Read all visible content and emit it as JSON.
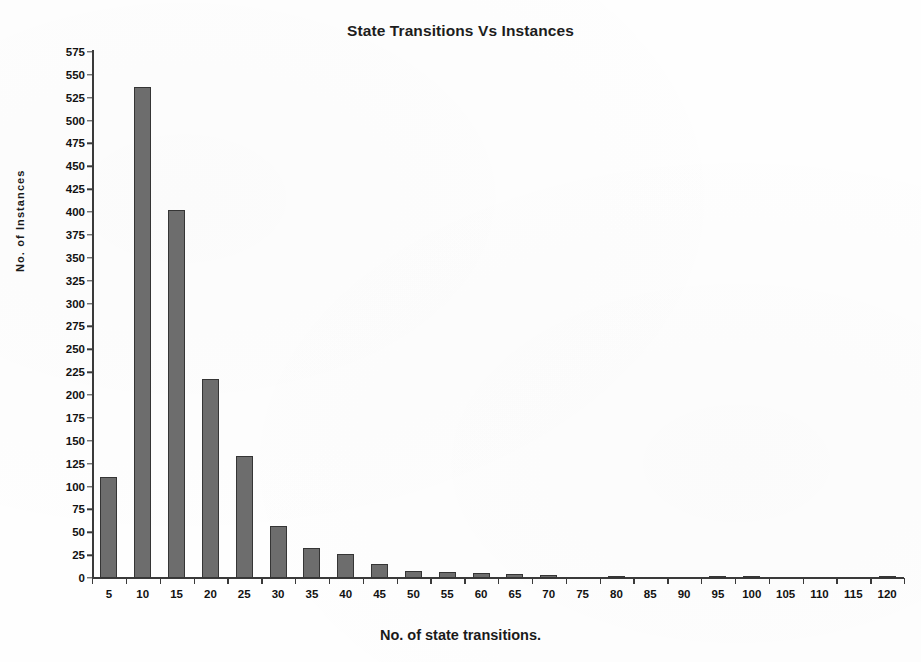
{
  "chart_data": {
    "type": "bar",
    "title": "State Transitions Vs Instances",
    "xlabel": "No. of state transitions.",
    "ylabel": "No. of Instances",
    "categories": [
      5,
      10,
      15,
      20,
      25,
      30,
      35,
      40,
      45,
      50,
      55,
      60,
      65,
      70,
      75,
      80,
      85,
      90,
      95,
      100,
      105,
      110,
      115,
      120
    ],
    "values": [
      110,
      537,
      402,
      218,
      133,
      57,
      33,
      26,
      15,
      8,
      7,
      6,
      4,
      3,
      0,
      2,
      0,
      0,
      1,
      1,
      0,
      0,
      0,
      1
    ],
    "ylim": [
      0,
      575
    ],
    "ytick_step": 25,
    "yticks": [
      0,
      25,
      50,
      75,
      100,
      125,
      150,
      175,
      200,
      225,
      250,
      275,
      300,
      325,
      350,
      375,
      400,
      425,
      450,
      475,
      500,
      525,
      550,
      575
    ],
    "xticks": [
      5,
      10,
      15,
      20,
      25,
      30,
      35,
      40,
      45,
      50,
      55,
      60,
      65,
      70,
      75,
      80,
      85,
      90,
      95,
      100,
      105,
      110,
      115,
      120
    ],
    "grid": false,
    "legend": false,
    "bar_color": "#6d6d6d",
    "bar_edge_color": "#353535",
    "axis_color": "#3a3a3a",
    "background": "#ffffff"
  }
}
